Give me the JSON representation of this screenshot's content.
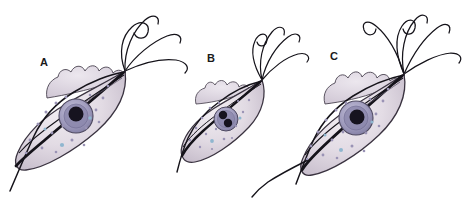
{
  "figure": {
    "background_color": "#ffffff",
    "caption_partial": "",
    "organisms": [
      {
        "label": "A",
        "label_x": 44,
        "label_y": 66,
        "description": "flagellate protozoan with undulating membrane, anterior flagellar tuft and trailing flagellum",
        "body_center_x": 72,
        "body_center_y": 122,
        "body_rx": 55,
        "body_ry": 31,
        "body_rotation": -38,
        "body_fill": "#ded7e2",
        "body_stroke": "#3a3340",
        "nucleus_cx": 76,
        "nucleus_cy": 116,
        "nucleus_r": 17,
        "nucleus_outer_fill": "#a9a6c4",
        "nucleus_mid_fill": "#8c88ad",
        "karyosome_fill": "#16131f",
        "karyosomes": [
          {
            "cx": 76,
            "cy": 114,
            "r": 7.5
          }
        ],
        "granule_fill": "#9a93b5",
        "granule_blue_fill": "#8fb6cf",
        "membrane_crests": 7,
        "flagella_count": 4,
        "has_trailing_flagellum": true
      },
      {
        "label": "B",
        "label_x": 211,
        "label_y": 62,
        "description": "smaller flagellate with binucleate karyosomes and short flagellar tuft",
        "body_center_x": 223,
        "body_center_y": 131,
        "body_rx": 42,
        "body_ry": 26,
        "body_rotation": -38,
        "body_fill": "#ded7e2",
        "body_stroke": "#3a3340",
        "nucleus_cx": 226,
        "nucleus_cy": 119,
        "nucleus_r": 12,
        "nucleus_outer_fill": "#a9a6c4",
        "nucleus_mid_fill": "#8c88ad",
        "karyosome_fill": "#16131f",
        "karyosomes": [
          {
            "cx": 223,
            "cy": 115,
            "r": 4.2
          },
          {
            "cx": 228,
            "cy": 123,
            "r": 4.2
          }
        ],
        "granule_fill": "#9a93b5",
        "granule_blue_fill": "#8fb6cf",
        "membrane_crests": 5,
        "flagella_count": 4,
        "has_trailing_flagellum": true
      },
      {
        "label": "C",
        "label_x": 334,
        "label_y": 60,
        "description": "flagellate with prominent ringed nucleus, scalloped undulating membrane and long flagellar tuft",
        "body_center_x": 352,
        "body_center_y": 124,
        "body_rx": 52,
        "body_ry": 30,
        "body_rotation": -40,
        "body_fill": "#ded7e2",
        "body_stroke": "#3a3340",
        "nucleus_cx": 356,
        "nucleus_cy": 118,
        "nucleus_r": 17,
        "nucleus_outer_fill": "#a9a6c4",
        "nucleus_mid_fill": "#8c88ad",
        "karyosome_fill": "#16131f",
        "karyosomes": [
          {
            "cx": 357,
            "cy": 117,
            "r": 7.5
          }
        ],
        "granule_fill": "#9a93b5",
        "granule_blue_fill": "#8fb6cf",
        "membrane_crests": 7,
        "flagella_count": 5,
        "has_trailing_flagellum": true
      }
    ]
  }
}
